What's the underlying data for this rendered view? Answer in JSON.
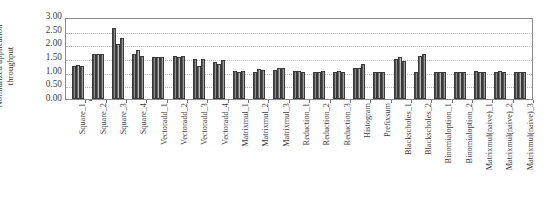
{
  "chart_data": {
    "type": "bar",
    "title": "",
    "subtitle": "",
    "xlabel": "",
    "ylabel": "Normalized application throughput",
    "ylabel_line1": "Normalized application",
    "ylabel_line2": "throughput",
    "ylim": [
      0,
      3.0
    ],
    "ytick_labels": [
      "0.00",
      "0.50",
      "1.00",
      "1.50",
      "2.00",
      "2.50",
      "3.00"
    ],
    "ytick_values": [
      0.0,
      0.5,
      1.0,
      1.5,
      2.0,
      2.5,
      3.0
    ],
    "grid": true,
    "grid_style": "dotted-horizontal",
    "legend": "none",
    "legend_position": "none",
    "bars_per_group": 3,
    "categories": [
      "Square_1",
      "Square_2",
      "Square_3",
      "Square_4",
      "Vectoradd_1",
      "Vectoradd_2",
      "Vectoradd_3",
      "Vectoradd_4",
      "Matrixmul_1",
      "Matrixmul_2",
      "Matrixmul_3",
      "Reduction_1",
      "Reduction_2",
      "Reduction_3",
      "Histogram",
      "Prefixsum",
      "Blackscholes_1",
      "Blackscholes_2",
      "Binomialoption_1",
      "Binomialoption_2",
      "Matrixmul(naive)_1",
      "Matrixmul(naive)_2",
      "Matrixmul(naive)_3"
    ],
    "series": [
      {
        "name": "series_1",
        "values": [
          1.22,
          1.65,
          2.58,
          1.66,
          1.52,
          1.58,
          1.46,
          1.37,
          1.01,
          1.0,
          1.07,
          1.01,
          1.0,
          1.0,
          1.12,
          1.0,
          1.48,
          1.0,
          1.0,
          1.0,
          1.01,
          1.0,
          1.0
        ]
      },
      {
        "name": "series_2",
        "values": [
          1.23,
          1.66,
          2.0,
          1.79,
          1.53,
          1.55,
          1.22,
          1.28,
          1.0,
          1.09,
          1.14,
          1.01,
          1.0,
          1.01,
          1.12,
          1.0,
          1.52,
          1.57,
          1.0,
          1.0,
          1.0,
          1.01,
          1.0
        ]
      },
      {
        "name": "series_3",
        "values": [
          1.19,
          1.66,
          2.22,
          1.57,
          1.53,
          1.57,
          1.47,
          1.43,
          1.01,
          1.07,
          1.14,
          1.0,
          1.01,
          1.0,
          1.27,
          1.0,
          1.4,
          1.64,
          1.0,
          1.0,
          1.0,
          1.0,
          1.0
        ]
      }
    ]
  }
}
